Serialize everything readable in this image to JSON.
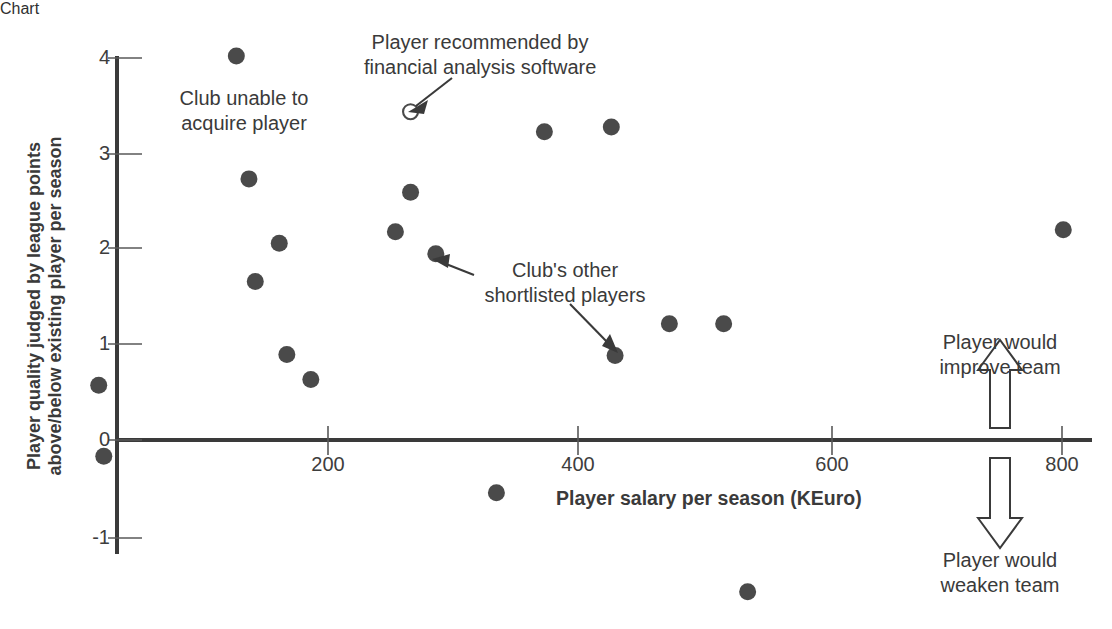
{
  "chart_data": {
    "type": "scatter",
    "title": "",
    "xlabel": "Player salary per season (KEuro)",
    "ylabel": "Player quality judged by league points above/below existing player per season",
    "ylabel_line1": "Player quality judged by league points",
    "ylabel_line2": "above/below existing player per season",
    "xlim": [
      -40,
      820
    ],
    "ylim": [
      -1,
      4
    ],
    "xticks": [
      200,
      400,
      600,
      800
    ],
    "xtick_labels": [
      "200",
      "400",
      "600",
      "800"
    ],
    "yticks": [
      -1,
      0,
      1,
      2,
      3,
      4
    ],
    "ytick_labels": [
      "-1",
      "0",
      "1",
      "2",
      "3",
      "4"
    ],
    "grid": false,
    "legend": "none",
    "series": [
      {
        "name": "Club's other shortlisted players",
        "marker": "filled-circle",
        "color": "#4a4a4a",
        "points": [
          {
            "x": 127,
            "y": 4.0
          },
          {
            "x": 137,
            "y": 2.72
          },
          {
            "x": 142,
            "y": 1.65
          },
          {
            "x": 161,
            "y": 2.05
          },
          {
            "x": 167,
            "y": 0.89
          },
          {
            "x": 186,
            "y": 0.63
          },
          {
            "x": 18,
            "y": 0.57
          },
          {
            "x": 22,
            "y": -0.17
          },
          {
            "x": 253,
            "y": 2.17
          },
          {
            "x": 265,
            "y": 2.58
          },
          {
            "x": 285,
            "y": 1.94
          },
          {
            "x": 333,
            "y": -0.55
          },
          {
            "x": 371,
            "y": 3.21
          },
          {
            "x": 424,
            "y": 3.26
          },
          {
            "x": 427,
            "y": 0.88
          },
          {
            "x": 470,
            "y": 1.21
          },
          {
            "x": 513,
            "y": 1.21
          },
          {
            "x": 532,
            "y": -1.58
          },
          {
            "x": 782,
            "y": 2.19
          }
        ]
      },
      {
        "name": "Player recommended by financial analysis software",
        "marker": "open-circle",
        "color": "#4a4a4a",
        "points": [
          {
            "x": 265,
            "y": 3.42
          }
        ]
      }
    ],
    "annotations": [
      {
        "id": "club-unable",
        "text": "Club unable to\nacquire player",
        "line1": "Club unable to",
        "line2": "acquire player",
        "has_arrow": false
      },
      {
        "id": "recommended",
        "text": "Player recommended by\nfinancial analysis software",
        "line1": "Player recommended by",
        "line2": "financial analysis software",
        "has_arrow": true,
        "target": {
          "x": 265,
          "y": 3.42
        }
      },
      {
        "id": "shortlisted",
        "text": "Club's other\nshortlisted players",
        "line1": "Club's other",
        "line2": "shortlisted players",
        "has_arrow": true
      },
      {
        "id": "improve",
        "text": "Player would\nimprove team",
        "line1": "Player would",
        "line2": "improve team",
        "arrow_direction": "up"
      },
      {
        "id": "weaken",
        "text": "Player would\nweaken team",
        "line1": "Player would",
        "line2": "weaken team",
        "arrow_direction": "down"
      }
    ]
  },
  "colors": {
    "marker": "#4a4a4a",
    "axis": "#3a3a3a",
    "text": "#3a3a3a",
    "background": "#ffffff"
  }
}
